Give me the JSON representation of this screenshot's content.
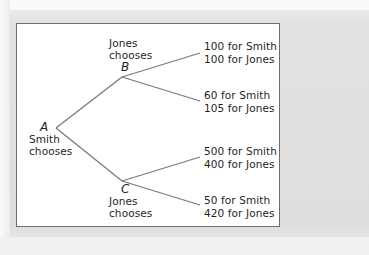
{
  "diagram": {
    "type": "game-tree",
    "line_color": "#7a7a7a",
    "nodes": {
      "A": {
        "label": "A",
        "caption_line1": "Smith",
        "caption_line2": "chooses"
      },
      "B": {
        "label": "B",
        "caption_line1": "Jones",
        "caption_line2": "chooses"
      },
      "C": {
        "label": "C",
        "caption_line1": "Jones",
        "caption_line2": "chooses"
      }
    },
    "payoffs": [
      {
        "from": "B",
        "smith": "100 for Smith",
        "jones": "100 for Jones"
      },
      {
        "from": "B",
        "smith": "60 for Smith",
        "jones": "105 for Jones"
      },
      {
        "from": "C",
        "smith": "500 for Smith",
        "jones": "400 for Jones"
      },
      {
        "from": "C",
        "smith": "50 for Smith",
        "jones": "420 for Jones"
      }
    ]
  }
}
